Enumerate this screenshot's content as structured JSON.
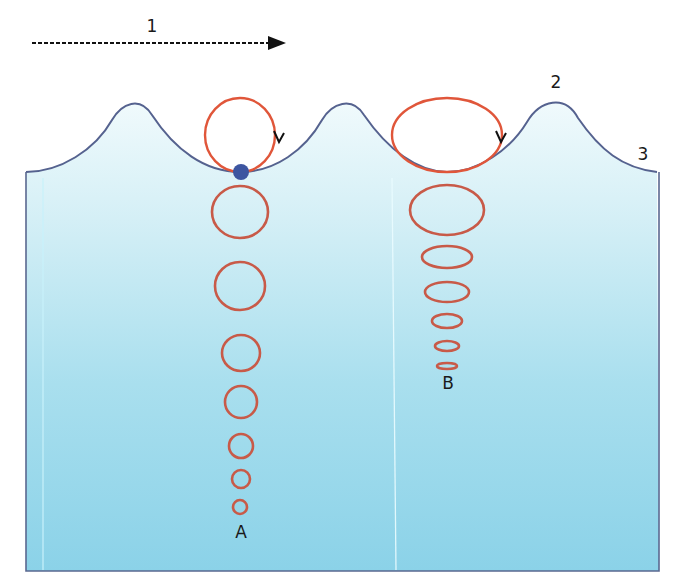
{
  "diagram": {
    "labels": {
      "direction": "1",
      "crest": "2",
      "trough": "3",
      "column_a": "A",
      "column_b": "B"
    },
    "colors": {
      "orbit": "#d9553a",
      "surface_line": "#4a5a8a",
      "particle": "#3d55a0",
      "water_top": "#eaf8fb",
      "water_bottom": "#8dd3e8",
      "arrow": "#111111"
    },
    "column_a_orbits": [
      {
        "cx": 240,
        "cy": 135,
        "rx": 35,
        "ry": 37
      },
      {
        "cx": 240,
        "cy": 212,
        "rx": 28,
        "ry": 26
      },
      {
        "cx": 240,
        "cy": 286,
        "rx": 25,
        "ry": 24
      },
      {
        "cx": 241,
        "cy": 353,
        "rx": 19,
        "ry": 18
      },
      {
        "cx": 241,
        "cy": 402,
        "rx": 16,
        "ry": 16
      },
      {
        "cx": 241,
        "cy": 446,
        "rx": 12,
        "ry": 12
      },
      {
        "cx": 241,
        "cy": 479,
        "rx": 9,
        "ry": 9
      },
      {
        "cx": 240,
        "cy": 507,
        "rx": 7,
        "ry": 7
      }
    ],
    "column_b_orbits": [
      {
        "cx": 447,
        "cy": 135,
        "rx": 55,
        "ry": 37
      },
      {
        "cx": 447,
        "cy": 210,
        "rx": 37,
        "ry": 25
      },
      {
        "cx": 447,
        "cy": 257,
        "rx": 25,
        "ry": 11
      },
      {
        "cx": 447,
        "cy": 292,
        "rx": 22,
        "ry": 10
      },
      {
        "cx": 447,
        "cy": 321,
        "rx": 15,
        "ry": 7
      },
      {
        "cx": 447,
        "cy": 346,
        "rx": 12,
        "ry": 5
      },
      {
        "cx": 447,
        "cy": 366,
        "rx": 10,
        "ry": 3
      }
    ],
    "particle": {
      "cx": 241,
      "cy": 172,
      "r": 8
    }
  }
}
